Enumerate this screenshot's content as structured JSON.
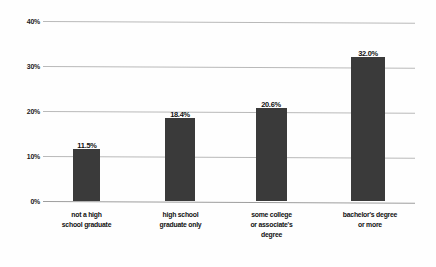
{
  "chart_data": {
    "type": "bar",
    "title": "",
    "subtitle": "",
    "xlabel": "",
    "ylabel": "",
    "categories": [
      "not a high school graduate",
      "high school graduate only",
      "some college or associate's degree",
      "bachelor's degree or more"
    ],
    "category_lines": [
      [
        "not a high",
        "school graduate"
      ],
      [
        "high school",
        "graduate only"
      ],
      [
        "some college",
        "or associate's",
        "degree"
      ],
      [
        "bachelor's degree",
        "or more"
      ]
    ],
    "values": [
      11.5,
      18.4,
      20.6,
      32.0
    ],
    "value_labels": [
      "11.5%",
      "18.4%",
      "20.6%",
      "32.0%"
    ],
    "ylim": [
      0,
      40
    ],
    "yticks": [
      40,
      30,
      20,
      10,
      0
    ],
    "ytick_labels": [
      "40%",
      "30%",
      "20%",
      "10%",
      "0%"
    ],
    "grid": true,
    "legend": "none",
    "bar_color": "#3a3a3a",
    "gridline_color": "#b9b9b9",
    "background_color": "#ffffff"
  }
}
